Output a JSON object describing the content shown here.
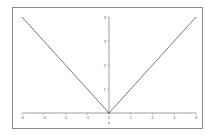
{
  "chart_data": {
    "type": "line",
    "title": "",
    "xlabel": "x",
    "ylabel": "",
    "xlim": [
      -4,
      4
    ],
    "ylim": [
      0,
      4
    ],
    "grid": false,
    "legend": null,
    "x_ticks": [
      "-4",
      "-3",
      "-2",
      "-1",
      "0",
      "1",
      "2",
      "3",
      "4"
    ],
    "y_ticks": [
      "1",
      "2",
      "3",
      "4"
    ],
    "series": [
      {
        "name": "|x|",
        "x": [
          -4,
          -3,
          -2,
          -1,
          0,
          1,
          2,
          3,
          4
        ],
        "y": [
          4,
          3,
          2,
          1,
          0,
          1,
          2,
          3,
          4
        ],
        "color": "#555555"
      }
    ]
  },
  "colors": {
    "line": "#555555",
    "axis": "#777777",
    "frame": "#8a8a8a",
    "background": "#ffffff"
  }
}
